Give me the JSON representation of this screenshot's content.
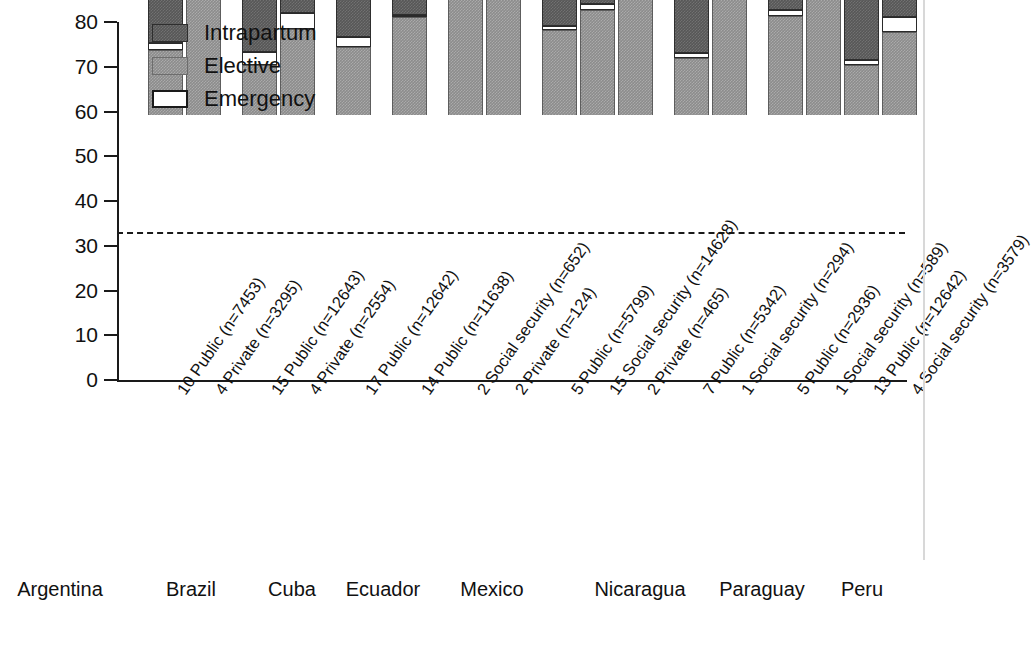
{
  "chart_data": {
    "type": "bar",
    "subtype": "stacked-bar-grouped",
    "title": "",
    "xlabel": "",
    "ylabel": "",
    "ylim": [
      0,
      80
    ],
    "ytick_values": [
      0,
      10,
      20,
      30,
      40,
      50,
      60,
      70,
      80
    ],
    "ytick_labels": [
      "0",
      "10",
      "20",
      "30",
      "40",
      "50",
      "60",
      "70",
      "80"
    ],
    "grid": false,
    "legend_position": "top-left",
    "reference_line": {
      "value": 33,
      "style": "dashed",
      "color": "#1a1a1a"
    },
    "series": [
      {
        "name": "Elective",
        "key": "elective",
        "color": "#8c8c8c"
      },
      {
        "name": "Emergency",
        "key": "emergency",
        "color": "#ffffff"
      },
      {
        "name": "Intrapartum",
        "key": "intrapartum",
        "color": "#575757"
      }
    ],
    "legend_order": [
      "Intrapartum",
      "Elective",
      "Emergency"
    ],
    "countries": [
      {
        "name": "Argentina",
        "first_bar": 0,
        "bar_count": 2
      },
      {
        "name": "Brazil",
        "first_bar": 2,
        "bar_count": 2
      },
      {
        "name": "Cuba",
        "first_bar": 4,
        "bar_count": 1
      },
      {
        "name": "Ecuador",
        "first_bar": 5,
        "bar_count": 1
      },
      {
        "name": "Mexico",
        "first_bar": 6,
        "bar_count": 2
      },
      {
        "name": "Nicaragua",
        "first_bar": 8,
        "bar_count": 3
      },
      {
        "name": "Paraguay",
        "first_bar": 11,
        "bar_count": 2
      },
      {
        "name": "Peru",
        "first_bar": 13,
        "bar_count": 3
      }
    ],
    "bars": [
      {
        "label": "10 Public (n=7453)",
        "group": "Argentina",
        "elective": 14.6,
        "emergency": 1.4,
        "intrapartum": 11.8,
        "total": 27.8
      },
      {
        "label": "4 Private (n=3295)",
        "group": "Argentina",
        "elective": 32.3,
        "emergency": 0.0,
        "intrapartum": 13.0,
        "total": 45.3
      },
      {
        "label": "15 Public (n=12643)",
        "group": "Brazil",
        "elective": 11.2,
        "emergency": 2.8,
        "intrapartum": 14.7,
        "total": 28.7
      },
      {
        "label": "4 Private (n=2554)",
        "group": "Brazil",
        "elective": 19.2,
        "emergency": 3.5,
        "intrapartum": 10.6,
        "total": 33.3
      },
      {
        "label": "17 Public (n=12642)",
        "group": "Cuba",
        "elective": 15.2,
        "emergency": 2.2,
        "intrapartum": 18.1,
        "total": 35.5
      },
      {
        "label": "14 Public (n=11638)",
        "group": "Ecuador",
        "elective": 22.0,
        "emergency": 0.3,
        "intrapartum": 17.7,
        "total": 40.0
      },
      {
        "label": "2 Social security (n=652)",
        "group": "Mexico",
        "elective": 37.8,
        "emergency": 1.3,
        "intrapartum": 2.7,
        "total": 41.8
      },
      {
        "label": "2 Private (n=124)",
        "group": "Mexico",
        "elective": 52.8,
        "emergency": 2.6,
        "intrapartum": 4.8,
        "total": 60.2
      },
      {
        "label": "5 Public (n=5799)",
        "group": "Nicaragua",
        "elective": 18.9,
        "emergency": 1.0,
        "intrapartum": 9.6,
        "total": 29.5
      },
      {
        "label": "15 Social security (n=14628)",
        "group": "Nicaragua",
        "elective": 23.5,
        "emergency": 1.4,
        "intrapartum": 16.0,
        "total": 40.9
      },
      {
        "label": "2 Private (n=465)",
        "group": "Nicaragua",
        "elective": 61.5,
        "emergency": 6.0,
        "intrapartum": 7.0,
        "total": 74.5
      },
      {
        "label": "7 Public (n=5342)",
        "group": "Paraguay",
        "elective": 12.8,
        "emergency": 1.1,
        "intrapartum": 16.8,
        "total": 30.7
      },
      {
        "label": "1 Social security (n=294)",
        "group": "Paraguay",
        "elective": 31.2,
        "emergency": 5.3,
        "intrapartum": 16.0,
        "total": 52.5
      },
      {
        "label": "5 Public (n=2936)",
        "group": "Peru",
        "elective": 22.2,
        "emergency": 1.3,
        "intrapartum": 17.2,
        "total": 40.7
      },
      {
        "label": "1 Social security (n=589)",
        "group": "Peru",
        "elective": 44.6,
        "emergency": 2.2,
        "intrapartum": 7.6,
        "total": 54.4
      },
      {
        "label": "13 Public (n=12642)",
        "group": "Peru",
        "elective": 11.2,
        "emergency": 1.0,
        "intrapartum": 19.4,
        "total": 31.6
      },
      {
        "label": "4 Social security (n=3579)",
        "group": "Peru",
        "elective": 18.6,
        "emergency": 3.4,
        "intrapartum": 26.4,
        "total": 48.4
      }
    ]
  },
  "legend": {
    "items": [
      {
        "label": "Intrapartum",
        "swatch": "intrapartum-swatch"
      },
      {
        "label": "Elective",
        "swatch": "elective-swatch"
      },
      {
        "label": "Emergency",
        "swatch": "emergency-swatch"
      }
    ]
  }
}
